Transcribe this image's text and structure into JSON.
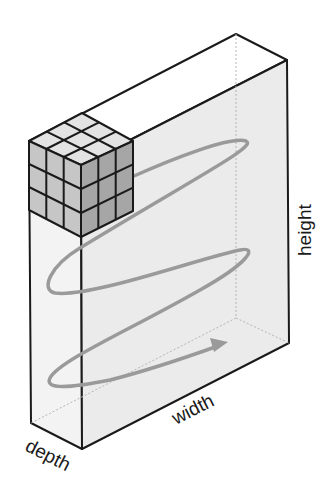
{
  "diagram": {
    "type": "3d-volume-scan-illustration",
    "labels": {
      "height": "height",
      "width": "width",
      "depth": "depth"
    },
    "colors": {
      "outline": "#1a1a1a",
      "front_face": "#ececec",
      "side_face": "#f2f2f2",
      "top_face": "#ffffff",
      "cube_top": "#e4e4e4",
      "cube_left": "#c8c8c8",
      "cube_right": "#a8a8a8",
      "spiral_arrow": "#9a9a9a",
      "hidden_edge": "#b0b0b0"
    },
    "kernel_cube": {
      "grid": "3x3x3"
    },
    "scan_path": {
      "description": "zig-zag spiral sweep from top to bottom, ending in an arrow"
    }
  }
}
